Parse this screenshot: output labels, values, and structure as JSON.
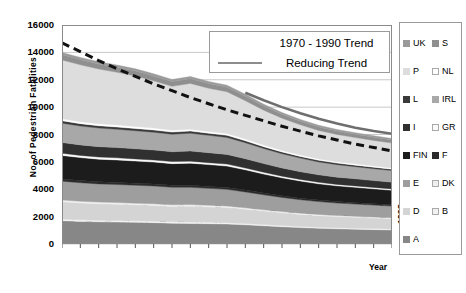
{
  "chart_data": {
    "type": "area",
    "title": "",
    "xlabel": "Year",
    "ylabel": "No. of Pedestrian Fatalities",
    "ylim": [
      0,
      16000
    ],
    "ytick_values": [
      0,
      2000,
      4000,
      6000,
      8000,
      10000,
      12000,
      14000,
      16000
    ],
    "ytick_labels": [
      "0",
      "2000",
      "4000",
      "6000",
      "8000",
      "10000",
      "12000",
      "14000",
      "16000"
    ],
    "grid": true,
    "legend_position": "right",
    "stacked": true,
    "categories": [
      "1980",
      "1981",
      "1982",
      "1983",
      "1984",
      "1985",
      "1986",
      "1987",
      "1988",
      "1989",
      "1990",
      "1991",
      "1992",
      "1993",
      "1994",
      "1995",
      "1996",
      "1997",
      "1998"
    ],
    "series": [
      {
        "name": "A",
        "color": "#878787",
        "values": [
          1700,
          1650,
          1620,
          1600,
          1580,
          1560,
          1520,
          1500,
          1480,
          1460,
          1400,
          1330,
          1260,
          1200,
          1150,
          1110,
          1080,
          1050,
          1020
        ]
      },
      {
        "name": "B",
        "color": "#f2f2f2",
        "values": [
          120,
          118,
          115,
          112,
          110,
          108,
          106,
          104,
          102,
          100,
          96,
          92,
          88,
          84,
          80,
          78,
          76,
          74,
          72
        ]
      },
      {
        "name": "D",
        "color": "#d4d4d4",
        "values": [
          1260,
          1230,
          1200,
          1190,
          1170,
          1150,
          1120,
          1160,
          1130,
          1100,
          1040,
          980,
          930,
          880,
          840,
          810,
          790,
          770,
          750
        ]
      },
      {
        "name": "DK",
        "color": "#efefef",
        "values": [
          130,
          128,
          126,
          124,
          122,
          120,
          118,
          116,
          114,
          112,
          106,
          100,
          95,
          90,
          86,
          83,
          80,
          78,
          76
        ]
      },
      {
        "name": "E",
        "color": "#9e9e9e",
        "values": [
          1380,
          1350,
          1330,
          1320,
          1310,
          1300,
          1280,
          1260,
          1240,
          1220,
          1160,
          1090,
          1030,
          980,
          940,
          910,
          890,
          870,
          850
        ]
      },
      {
        "name": "F",
        "color": "#2b2b2b",
        "values": [
          160,
          158,
          156,
          154,
          152,
          150,
          148,
          146,
          144,
          142,
          136,
          128,
          122,
          116,
          110,
          106,
          103,
          100,
          98
        ]
      },
      {
        "name": "FIN",
        "color": "#1c1c1c",
        "values": [
          1720,
          1680,
          1650,
          1640,
          1620,
          1600,
          1580,
          1620,
          1590,
          1560,
          1480,
          1390,
          1310,
          1250,
          1190,
          1150,
          1120,
          1090,
          1060
        ]
      },
      {
        "name": "GR",
        "color": "#fafafa",
        "values": [
          160,
          158,
          156,
          154,
          152,
          150,
          148,
          146,
          144,
          142,
          136,
          128,
          122,
          116,
          110,
          107,
          104,
          101,
          99
        ]
      },
      {
        "name": "I",
        "color": "#303030",
        "values": [
          780,
          770,
          760,
          750,
          740,
          730,
          720,
          740,
          725,
          710,
          675,
          635,
          600,
          570,
          545,
          530,
          515,
          500,
          490
        ]
      },
      {
        "name": "IRL",
        "color": "#a8a8a8",
        "values": [
          1420,
          1380,
          1360,
          1340,
          1320,
          1300,
          1280,
          1300,
          1270,
          1240,
          1170,
          1100,
          1040,
          990,
          945,
          915,
          890,
          870,
          850
        ]
      },
      {
        "name": "L",
        "color": "#3a3a3a",
        "values": [
          170,
          168,
          166,
          164,
          162,
          160,
          158,
          156,
          154,
          152,
          145,
          137,
          130,
          124,
          118,
          114,
          111,
          108,
          105
        ]
      },
      {
        "name": "NL",
        "color": "#ffffff",
        "values": [
          150,
          148,
          146,
          144,
          142,
          140,
          138,
          136,
          134,
          132,
          126,
          119,
          113,
          107,
          102,
          99,
          96,
          93,
          91
        ]
      },
      {
        "name": "P",
        "color": "#dddddd",
        "values": [
          4300,
          4150,
          4000,
          3850,
          3700,
          3450,
          3200,
          3350,
          3150,
          3050,
          2800,
          2550,
          2350,
          2200,
          2080,
          1990,
          1920,
          1860,
          1810
        ]
      },
      {
        "name": "S",
        "color": "#8f8f8f",
        "values": [
          380,
          375,
          370,
          365,
          360,
          355,
          350,
          345,
          340,
          335,
          320,
          300,
          285,
          270,
          258,
          250,
          243,
          237,
          232
        ]
      },
      {
        "name": "UK",
        "color": "#9a9a9a",
        "values": [
          170,
          168,
          166,
          164,
          162,
          160,
          158,
          156,
          154,
          152,
          145,
          137,
          130,
          124,
          118,
          114,
          111,
          108,
          105
        ]
      }
    ],
    "trend_lines": [
      {
        "name": "1970 - 1990 Trend",
        "style": "dashed",
        "color": "#111111",
        "values": [
          14700,
          14050,
          13400,
          12800,
          12250,
          11700,
          11200,
          10700,
          10250,
          9800,
          9400,
          9000,
          8600,
          8250,
          7900,
          7600,
          7300,
          7050,
          6800
        ]
      },
      {
        "name": "Reducing Trend",
        "style": "solid",
        "color": "#6e6e6e",
        "values": [
          null,
          null,
          null,
          null,
          null,
          null,
          null,
          null,
          null,
          null,
          11050,
          10500,
          10000,
          9550,
          9150,
          8800,
          8500,
          8250,
          8050
        ]
      }
    ]
  },
  "trend_legend": {
    "rows": [
      {
        "label": "1970 - 1990 Trend"
      },
      {
        "label": "Reducing Trend"
      }
    ]
  },
  "country_legend": {
    "column_left": [
      {
        "label": "UK",
        "color": "#9a9a9a"
      },
      {
        "label": "P",
        "color": "#dddddd"
      },
      {
        "label": "L",
        "color": "#3a3a3a"
      },
      {
        "label": "I",
        "color": "#303030"
      },
      {
        "label": "FIN",
        "color": "#1c1c1c"
      },
      {
        "label": "E",
        "color": "#9e9e9e"
      },
      {
        "label": "D",
        "color": "#d4d4d4"
      },
      {
        "label": "A",
        "color": "#878787"
      }
    ],
    "column_right": [
      {
        "label": "S",
        "color": "#8f8f8f"
      },
      {
        "label": "NL",
        "color": "#ffffff"
      },
      {
        "label": "IRL",
        "color": "#a8a8a8"
      },
      {
        "label": "GR",
        "color": "#fafafa"
      },
      {
        "label": "F",
        "color": "#2b2b2b"
      },
      {
        "label": "DK",
        "color": "#efefef"
      },
      {
        "label": "B",
        "color": "#f2f2f2"
      }
    ]
  }
}
